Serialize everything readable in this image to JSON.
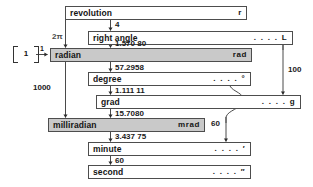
{
  "diagram": {
    "units": [
      {
        "id": "revolution",
        "name": "revolution",
        "symbol": "r",
        "shaded": false
      },
      {
        "id": "right-angle",
        "name": "right angle",
        "symbol": ". . . . L",
        "shaded": false
      },
      {
        "id": "radian",
        "name": "radian",
        "symbol": "rad",
        "shaded": true
      },
      {
        "id": "degree",
        "name": "degree",
        "symbol": ". . . . °",
        "shaded": false
      },
      {
        "id": "grad",
        "name": "grad",
        "symbol": ". . . . g",
        "shaded": false
      },
      {
        "id": "milliradian",
        "name": "milliradian",
        "symbol": "mrad",
        "shaded": true
      },
      {
        "id": "minute",
        "name": "minute",
        "symbol": ". . . . ′",
        "shaded": false
      },
      {
        "id": "second",
        "name": "second",
        "symbol": ". . . . ″",
        "shaded": false
      }
    ],
    "factors": [
      {
        "id": "rev-to-right-angle",
        "value": "4"
      },
      {
        "id": "rev-to-radian",
        "value": "2π"
      },
      {
        "id": "right-angle-to-radian",
        "value": "1.570 80"
      },
      {
        "id": "bracket-unity",
        "value": "1"
      },
      {
        "id": "radian-input",
        "value": "1"
      },
      {
        "id": "radian-to-degree",
        "value": "57.2958"
      },
      {
        "id": "degree-to-grad",
        "value": "1.111 11"
      },
      {
        "id": "radian-to-milliradian",
        "value": "1000"
      },
      {
        "id": "grad-to-milliradian",
        "value": "15.7080"
      },
      {
        "id": "right-angle-to-grad",
        "value": "100"
      },
      {
        "id": "degree-to-minute",
        "value": "60"
      },
      {
        "id": "milliradian-to-minute",
        "value": "3.437 75"
      },
      {
        "id": "minute-to-second",
        "value": "60"
      }
    ]
  },
  "colors": {
    "shaded_fill": "#c9c9c9",
    "box_border": "#4d4d4d",
    "text": "#141414",
    "background": "#ffffff"
  }
}
